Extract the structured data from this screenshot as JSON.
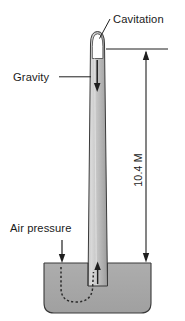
{
  "figure": {
    "background_color": "#ffffff",
    "ink_color": "#1f1f1f",
    "liquid_color": "#a8a8a8",
    "tube_color_light": "#d6d6d6",
    "tube_color_dark": "#9a9a9a",
    "void_color": "#ffffff"
  },
  "labels": {
    "cavitation": "Cavitation",
    "gravity": "Gravity",
    "air_pressure": "Air pressure",
    "height_dimension": "10.4 M"
  },
  "icons": {
    "gravity_arrow": "arrow-down-icon",
    "air_pressure_arrow": "arrow-down-icon",
    "suction_arrow": "arrow-up-icon",
    "dimension_arrow_top": "arrow-up-icon",
    "dimension_arrow_bottom": "arrow-down-icon",
    "flow_path": "dashed-curve-icon",
    "leader_cavitation": "leader-line-icon",
    "leader_gravity": "leader-line-icon"
  },
  "annotations": [
    {
      "name": "cavitation",
      "text": "Cavitation",
      "points_to": "tube-top-void"
    },
    {
      "name": "gravity",
      "text": "Gravity",
      "points_to": "tube-downward-arrow"
    },
    {
      "name": "air-pressure",
      "text": "Air pressure",
      "points_to": "reservoir-surface"
    },
    {
      "name": "height",
      "text": "10.4 M",
      "points_to": "column-height-dimension"
    }
  ]
}
